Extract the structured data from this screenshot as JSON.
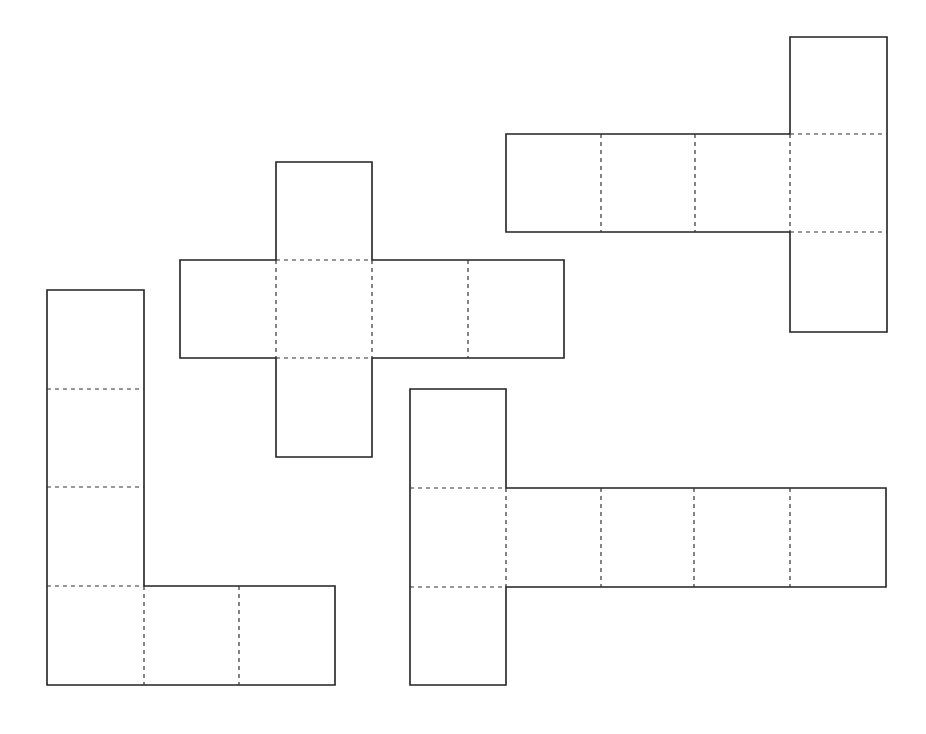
{
  "diagram": {
    "type": "cube-nets",
    "background": "#ffffff",
    "line_color": "#222222",
    "nets": [
      {
        "name": "cross-net",
        "squares": 6,
        "outline": [
          [
            276,
            162
          ],
          [
            372,
            162
          ],
          [
            372,
            260
          ],
          [
            564,
            260
          ],
          [
            564,
            358
          ],
          [
            372,
            358
          ],
          [
            372,
            457
          ],
          [
            276,
            457
          ],
          [
            276,
            358
          ],
          [
            180,
            358
          ],
          [
            180,
            260
          ],
          [
            276,
            260
          ]
        ],
        "folds": [
          [
            [
              276,
              260
            ],
            [
              372,
              260
            ]
          ],
          [
            [
              276,
              358
            ],
            [
              372,
              358
            ]
          ],
          [
            [
              276,
              260
            ],
            [
              276,
              358
            ]
          ],
          [
            [
              372,
              260
            ],
            [
              372,
              358
            ]
          ],
          [
            [
              468,
              260
            ],
            [
              468,
              358
            ]
          ]
        ]
      },
      {
        "name": "top-right-net",
        "squares": 6,
        "outline": [
          [
            790,
            37
          ],
          [
            887,
            37
          ],
          [
            887,
            332
          ],
          [
            790,
            332
          ],
          [
            790,
            232
          ],
          [
            506,
            232
          ],
          [
            506,
            134
          ],
          [
            790,
            134
          ]
        ],
        "folds": [
          [
            [
              601,
              134
            ],
            [
              601,
              232
            ]
          ],
          [
            [
              695,
              134
            ],
            [
              695,
              232
            ]
          ],
          [
            [
              790,
              134
            ],
            [
              790,
              232
            ]
          ],
          [
            [
              790,
              134
            ],
            [
              887,
              134
            ]
          ],
          [
            [
              790,
              232
            ],
            [
              887,
              232
            ]
          ]
        ]
      },
      {
        "name": "l-shape-net",
        "squares": 6,
        "outline": [
          [
            47,
            290
          ],
          [
            144,
            290
          ],
          [
            144,
            586
          ],
          [
            335,
            586
          ],
          [
            335,
            685
          ],
          [
            47,
            685
          ]
        ],
        "folds": [
          [
            [
              47,
              389
            ],
            [
              144,
              389
            ]
          ],
          [
            [
              47,
              487
            ],
            [
              144,
              487
            ]
          ],
          [
            [
              47,
              586
            ],
            [
              144,
              586
            ]
          ],
          [
            [
              144,
              586
            ],
            [
              144,
              685
            ]
          ],
          [
            [
              239,
              586
            ],
            [
              239,
              685
            ]
          ]
        ]
      },
      {
        "name": "bottom-right-net",
        "squares": 6,
        "outline": [
          [
            410,
            389
          ],
          [
            506,
            389
          ],
          [
            506,
            488
          ],
          [
            886,
            488
          ],
          [
            886,
            587
          ],
          [
            506,
            587
          ],
          [
            506,
            685
          ],
          [
            410,
            685
          ]
        ],
        "folds": [
          [
            [
              410,
              488
            ],
            [
              506,
              488
            ]
          ],
          [
            [
              410,
              587
            ],
            [
              506,
              587
            ]
          ],
          [
            [
              506,
              488
            ],
            [
              506,
              587
            ]
          ],
          [
            [
              601,
              488
            ],
            [
              601,
              587
            ]
          ],
          [
            [
              694,
              488
            ],
            [
              694,
              587
            ]
          ],
          [
            [
              790,
              488
            ],
            [
              790,
              587
            ]
          ]
        ]
      }
    ]
  }
}
